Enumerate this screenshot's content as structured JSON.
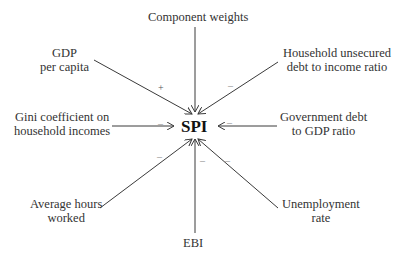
{
  "center": {
    "label": "SPI"
  },
  "nodes": [
    {
      "id": "component-weights",
      "lines": [
        "Component weights"
      ],
      "sign": ""
    },
    {
      "id": "gdp-per-capita",
      "lines": [
        "GDP",
        "per capita"
      ],
      "sign": "+"
    },
    {
      "id": "household-debt",
      "lines": [
        "Household unsecured",
        "debt to income ratio"
      ],
      "sign": "–"
    },
    {
      "id": "gini",
      "lines": [
        "Gini coefficient on",
        "household incomes"
      ],
      "sign": "–"
    },
    {
      "id": "government-debt",
      "lines": [
        "Government debt",
        "to GDP ratio"
      ],
      "sign": "–"
    },
    {
      "id": "average-hours",
      "lines": [
        "Average hours",
        "worked"
      ],
      "sign": "–"
    },
    {
      "id": "ebi",
      "lines": [
        "EBI"
      ],
      "sign": "–"
    },
    {
      "id": "unemployment",
      "lines": [
        "Unemployment",
        "rate"
      ],
      "sign": "–"
    }
  ],
  "colors": {
    "line": "#3a3a3a",
    "text": "#333333",
    "sign": "#888888"
  }
}
